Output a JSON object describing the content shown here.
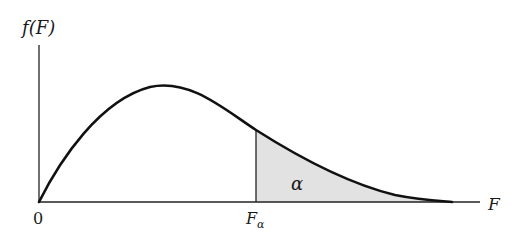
{
  "diagram": {
    "y_axis_label": "f(F)",
    "x_axis_label": "F",
    "origin_label": "0",
    "critical_value_label": "F",
    "critical_value_subscript": "α",
    "shaded_area_label": "α",
    "colors": {
      "curve": "#111111",
      "axis": "#222222",
      "shade": "#e2e2e2"
    }
  }
}
